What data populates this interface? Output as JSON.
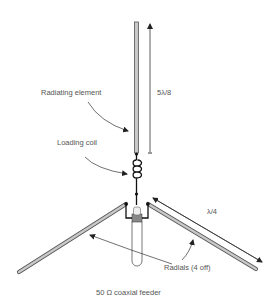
{
  "diagram": {
    "labels": {
      "radiating_element": "Radiating element",
      "loading_coil": "Loading coil",
      "element_length": "5λ/8",
      "radial_length": "λ/4",
      "radials": "Radials (4 off)",
      "feeder": "50 Ω coaxial feeder"
    },
    "colors": {
      "element_fill": "#c8c8c8",
      "element_stroke": "#555555",
      "wire": "#222222",
      "annotation_text": "#555555",
      "background": "#ffffff"
    }
  }
}
